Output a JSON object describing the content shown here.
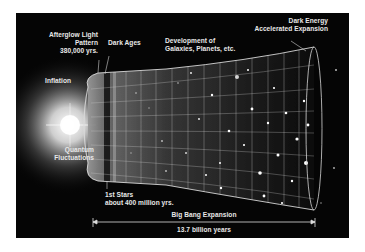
{
  "diagram": {
    "labels": {
      "afterglow": [
        "Afterglow Light",
        "Pattern",
        "380,000 yrs."
      ],
      "dark_ages": "Dark Ages",
      "development": [
        "Development of",
        "Galaxies, Planets, etc."
      ],
      "dark_energy": [
        "Dark Energy",
        "Accelerated Expansion"
      ],
      "inflation": "Inflation",
      "quantum": [
        "Quantum",
        "Fluctuations"
      ],
      "first_stars": [
        "1st Stars",
        "about 400 million yrs."
      ],
      "expansion": "Big Bang Expansion",
      "duration": "13.7 billion years"
    },
    "colors": {
      "background": "#050505",
      "text": "#e8e8e8",
      "grid": "#cfcfcf",
      "page": "#ffffff"
    }
  }
}
